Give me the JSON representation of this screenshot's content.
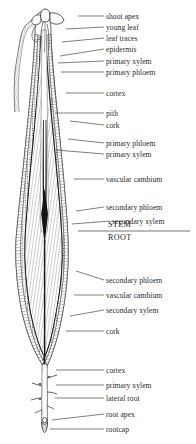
{
  "figure": {
    "background_color": "#ffffff",
    "ink_color": "#2a2a2a",
    "divider": {
      "stem_label": "STEM",
      "root_label": "ROOT"
    }
  },
  "labels": [
    {
      "id": "shoot-apex",
      "text": "shoot apex",
      "x": 106,
      "y": 13,
      "leader": {
        "x1": 104,
        "y1": 16,
        "x2": 78,
        "y2": 16
      }
    },
    {
      "id": "young-leaf",
      "text": "young leaf",
      "x": 106,
      "y": 24,
      "leader": {
        "x1": 104,
        "y1": 27,
        "x2": 66,
        "y2": 29
      }
    },
    {
      "id": "leaf-traces",
      "text": "leaf traces",
      "x": 106,
      "y": 35,
      "leader": {
        "x1": 104,
        "y1": 38,
        "x2": 62,
        "y2": 42
      }
    },
    {
      "id": "epidermis",
      "text": "epidermis",
      "x": 106,
      "y": 46,
      "leader": {
        "x1": 104,
        "y1": 49,
        "x2": 60,
        "y2": 56
      }
    },
    {
      "id": "primary-xylem-1",
      "text": "primary xylem",
      "x": 106,
      "y": 58,
      "leader": {
        "x1": 104,
        "y1": 61,
        "x2": 58,
        "y2": 63
      }
    },
    {
      "id": "primary-phloem-1",
      "text": "primary phloem",
      "x": 106,
      "y": 69,
      "leader": {
        "x1": 104,
        "y1": 72,
        "x2": 61,
        "y2": 72
      }
    },
    {
      "id": "cortex-1",
      "text": "cortex",
      "x": 106,
      "y": 90,
      "leader": {
        "x1": 104,
        "y1": 93,
        "x2": 66,
        "y2": 93
      }
    },
    {
      "id": "pith",
      "text": "pith",
      "x": 106,
      "y": 110,
      "leader": {
        "x1": 104,
        "y1": 113,
        "x2": 55,
        "y2": 113
      }
    },
    {
      "id": "cork-1",
      "text": "cork",
      "x": 106,
      "y": 122,
      "leader": {
        "x1": 104,
        "y1": 125,
        "x2": 70,
        "y2": 121
      }
    },
    {
      "id": "primary-phloem-2",
      "text": "primary phloem",
      "x": 106,
      "y": 140,
      "leader": {
        "x1": 104,
        "y1": 143,
        "x2": 68,
        "y2": 139
      }
    },
    {
      "id": "primary-xylem-2",
      "text": "primary xylem",
      "x": 106,
      "y": 151,
      "leader": {
        "x1": 104,
        "y1": 154,
        "x2": 56,
        "y2": 150
      }
    },
    {
      "id": "vascular-cambium-1",
      "text": "vascular cambium",
      "x": 106,
      "y": 176,
      "leader": {
        "x1": 104,
        "y1": 179,
        "x2": 74,
        "y2": 179
      }
    },
    {
      "id": "secondary-phloem-1",
      "text": "secondary phloem",
      "x": 106,
      "y": 204,
      "leader": {
        "x1": 104,
        "y1": 207,
        "x2": 76,
        "y2": 211
      }
    },
    {
      "id": "secondary-xylem-1",
      "text": "secondary xylem",
      "x": 112,
      "y": 218,
      "leader": {
        "x1": 110,
        "y1": 221,
        "x2": 72,
        "y2": 224
      }
    },
    {
      "id": "secondary-phloem-2",
      "text": "secondary phloem",
      "x": 106,
      "y": 277,
      "leader": {
        "x1": 104,
        "y1": 280,
        "x2": 76,
        "y2": 271
      }
    },
    {
      "id": "vascular-cambium-2",
      "text": "vascular cambium",
      "x": 106,
      "y": 292,
      "leader": {
        "x1": 104,
        "y1": 295,
        "x2": 74,
        "y2": 295
      }
    },
    {
      "id": "secondary-xylem-2",
      "text": "secondary xylem",
      "x": 106,
      "y": 307,
      "leader": {
        "x1": 104,
        "y1": 310,
        "x2": 70,
        "y2": 316
      }
    },
    {
      "id": "cork-2",
      "text": "cork",
      "x": 106,
      "y": 328,
      "leader": {
        "x1": 104,
        "y1": 331,
        "x2": 66,
        "y2": 331
      }
    },
    {
      "id": "cortex-2",
      "text": "cortex",
      "x": 106,
      "y": 367,
      "leader": {
        "x1": 104,
        "y1": 370,
        "x2": 56,
        "y2": 370
      }
    },
    {
      "id": "primary-xylem-3",
      "text": "primary xylem",
      "x": 106,
      "y": 382,
      "leader": {
        "x1": 104,
        "y1": 385,
        "x2": 56,
        "y2": 385
      }
    },
    {
      "id": "lateral-root",
      "text": "lateral root",
      "x": 106,
      "y": 395,
      "leader": {
        "x1": 104,
        "y1": 398,
        "x2": 55,
        "y2": 398
      }
    },
    {
      "id": "root-apex",
      "text": "root apex",
      "x": 106,
      "y": 411,
      "leader": {
        "x1": 104,
        "y1": 414,
        "x2": 52,
        "y2": 420
      }
    },
    {
      "id": "rootcap",
      "text": "rootcap",
      "x": 106,
      "y": 426,
      "leader": {
        "x1": 104,
        "y1": 429,
        "x2": 50,
        "y2": 429
      }
    }
  ],
  "divider_line": {
    "x1": 78,
    "y1": 231,
    "x2": 190,
    "y2": 231
  },
  "divider_labels": [
    {
      "id": "stem",
      "text": "STEM",
      "x": 108,
      "y": 221
    },
    {
      "id": "root",
      "text": "ROOT",
      "x": 108,
      "y": 234
    }
  ]
}
